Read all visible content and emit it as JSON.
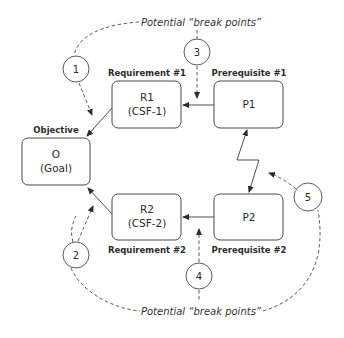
{
  "diagram": {
    "title_top": "Potential “break points”",
    "title_bottom": "Potential “break points”",
    "nodes": {
      "objective": {
        "label": "Objective",
        "line1": "O",
        "line2": "(Goal)"
      },
      "r1": {
        "label": "Requirement #1",
        "line1": "R1",
        "line2": "(CSF-1)"
      },
      "r2": {
        "label": "Requirement #2",
        "line1": "R2",
        "line2": "(CSF-2)"
      },
      "p1": {
        "label": "Prerequisite #1",
        "line1": "P1"
      },
      "p2": {
        "label": "Prerequisite #2",
        "line1": "P2"
      }
    },
    "break_points": [
      "1",
      "2",
      "3",
      "4",
      "5"
    ],
    "edges": [
      {
        "from": "R1",
        "to": "O",
        "style": "solid"
      },
      {
        "from": "R2",
        "to": "O",
        "style": "solid"
      },
      {
        "from": "P1",
        "to": "R1",
        "style": "solid"
      },
      {
        "from": "P2",
        "to": "R2",
        "style": "solid"
      },
      {
        "from": "P1",
        "to": "P2",
        "style": "zigzag-bidirectional"
      }
    ]
  }
}
